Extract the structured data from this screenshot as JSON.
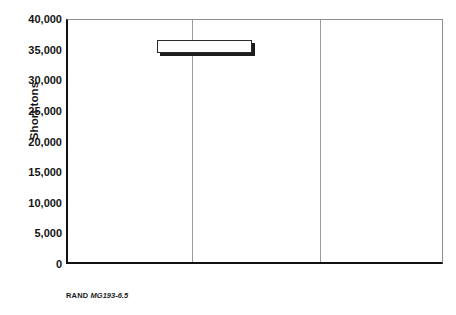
{
  "chart_data": {
    "type": "bar",
    "title": "",
    "xlabel": "",
    "ylabel": "Short tons",
    "ylim": [
      0,
      40000
    ],
    "yticks": [
      0,
      5000,
      10000,
      15000,
      20000,
      25000,
      30000,
      35000,
      40000
    ],
    "ytick_labels": [
      "0",
      "5,000",
      "10,000",
      "15,000",
      "20,000",
      "25,000",
      "30,000",
      "35,000",
      "40,000"
    ],
    "grid": false,
    "legend_position": "upper center",
    "categories": [
      "Munitions",
      "FOL support",
      "Spares"
    ],
    "series": [
      {
        "name": "Airlift",
        "color": "#dcdcdc",
        "values": [
          3400,
          15000,
          0
        ]
      },
      {
        "name": "Sealift",
        "color": "#8f8f8f",
        "values": [
          38800,
          0,
          300
        ]
      },
      {
        "name": "Line haul",
        "color": "#050505",
        "values": [
          200,
          27900,
          0
        ]
      }
    ]
  },
  "axis": {
    "y_title": "Short tons",
    "ticks": [
      {
        "label": "40,000",
        "value": 40000
      },
      {
        "label": "35,000",
        "value": 35000
      },
      {
        "label": "30,000",
        "value": 30000
      },
      {
        "label": "25,000",
        "value": 25000
      },
      {
        "label": "20,000",
        "value": 20000
      },
      {
        "label": "15,000",
        "value": 15000
      },
      {
        "label": "10,000",
        "value": 10000
      },
      {
        "label": "5,000",
        "value": 5000
      },
      {
        "label": "0",
        "value": 0
      }
    ]
  },
  "categories": [
    {
      "label": "Munitions"
    },
    {
      "label": "FOL support"
    },
    {
      "label": "Spares"
    }
  ],
  "legend": {
    "items": [
      {
        "label": "Airlift",
        "swatch": "airlift"
      },
      {
        "label": "Sealift",
        "swatch": "sealift"
      },
      {
        "label": "Line haul",
        "swatch": "linehaul"
      }
    ]
  },
  "caption": {
    "publisher": "RAND",
    "document_id": "MG193-6.5"
  }
}
